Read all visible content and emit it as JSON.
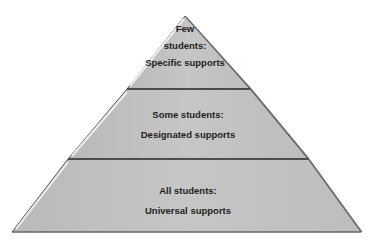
{
  "diagram": {
    "type": "pyramid",
    "tiers": [
      {
        "level": "top",
        "line1": "Few",
        "line2": "students:",
        "line3": "Specific  supports"
      },
      {
        "level": "middle",
        "line1": "Some students:",
        "line2": "Designated supports"
      },
      {
        "level": "bottom",
        "line1": "All students:",
        "line2": "Universal supports"
      }
    ],
    "colors": {
      "fill": "#c3c3c3",
      "stroke": "#4a4a4a",
      "highlight": "#e6e6e6",
      "text": "#1e1e1e"
    }
  }
}
